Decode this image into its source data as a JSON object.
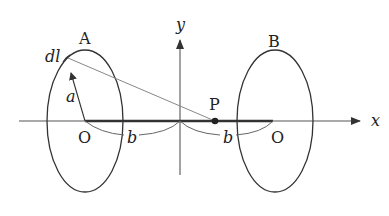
{
  "diagram": {
    "axes": {
      "x_label": "x",
      "y_label": "y"
    },
    "loops": [
      {
        "label": "A",
        "center_label": "O"
      },
      {
        "label": "B",
        "center_label": "O"
      }
    ],
    "labels": {
      "dl": "dl",
      "radius": "a",
      "distance_left": "b",
      "distance_right": "b",
      "point": "P"
    },
    "colors": {
      "stroke": "#333333",
      "thin_line": "#777777"
    }
  }
}
